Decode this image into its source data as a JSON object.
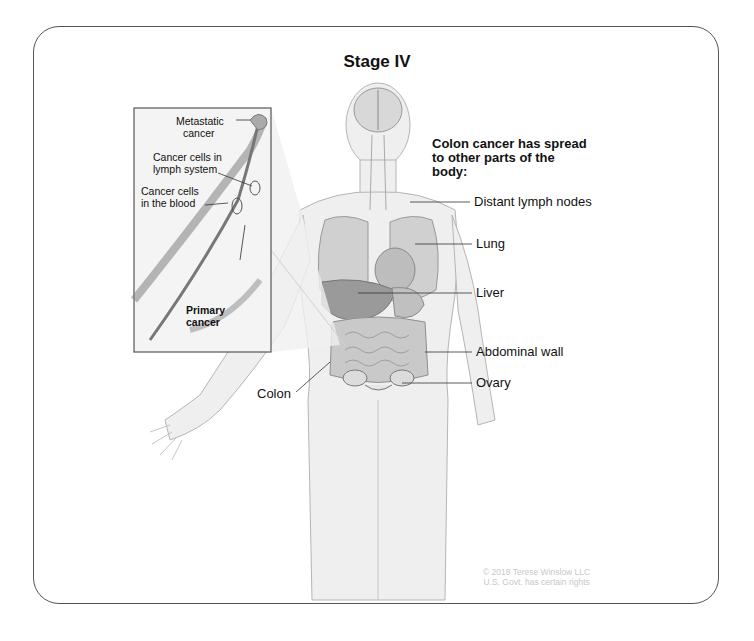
{
  "title": "Stage IV",
  "description": {
    "line1": "Colon cancer has spread",
    "line2": "to other parts of the",
    "line3": "body:"
  },
  "labels": {
    "distant_lymph_nodes": "Distant lymph nodes",
    "lung": "Lung",
    "liver": "Liver",
    "abdominal_wall": "Abdominal wall",
    "ovary": "Ovary",
    "colon": "Colon"
  },
  "inset": {
    "metastatic_1": "Metastatic",
    "metastatic_2": "cancer",
    "lymph_1": "Cancer cells in",
    "lymph_2": "lymph system",
    "blood_1": "Cancer cells",
    "blood_2": "in the blood",
    "primary_1": "Primary",
    "primary_2": "cancer"
  },
  "copyright": {
    "line1": "© 2018 Terese Winslow LLC",
    "line2": "U.S. Govt. has certain rights"
  }
}
